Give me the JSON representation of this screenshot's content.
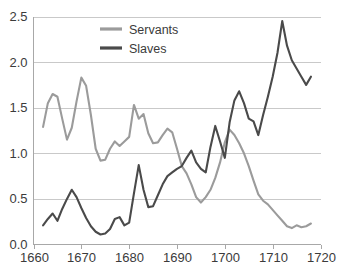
{
  "chart_data": {
    "type": "line",
    "title": "",
    "subtitle": "",
    "xlabel": "",
    "ylabel": "",
    "xlim": [
      1660,
      1720
    ],
    "ylim": [
      0.0,
      2.5
    ],
    "grid": true,
    "grid_axis": "y",
    "legend_position": "top-center",
    "x_ticks": [
      "1660",
      "1670",
      "1680",
      "1690",
      "1700",
      "1710",
      "1720"
    ],
    "x_tick_values": [
      1660,
      1670,
      1680,
      1690,
      1700,
      1710,
      1720
    ],
    "y_ticks": [
      "0.0",
      "0.5",
      "1.0",
      "1.5",
      "2.0",
      "2.5"
    ],
    "y_tick_values": [
      0.0,
      0.5,
      1.0,
      1.5,
      2.0,
      2.5
    ],
    "series": [
      {
        "name": "Servants",
        "color": "#9b9b9b",
        "x": [
          1662,
          1663,
          1664,
          1665,
          1666,
          1667,
          1668,
          1669,
          1670,
          1671,
          1672,
          1673,
          1674,
          1675,
          1676,
          1677,
          1678,
          1679,
          1680,
          1681,
          1682,
          1683,
          1684,
          1685,
          1686,
          1687,
          1688,
          1689,
          1690,
          1691,
          1692,
          1693,
          1694,
          1695,
          1696,
          1697,
          1698,
          1699,
          1700,
          1701,
          1702,
          1703,
          1704,
          1705,
          1706,
          1707,
          1708,
          1709,
          1710,
          1711,
          1712,
          1713,
          1714,
          1715,
          1716,
          1717,
          1718
        ],
        "values": [
          1.29,
          1.55,
          1.65,
          1.62,
          1.38,
          1.15,
          1.28,
          1.57,
          1.83,
          1.74,
          1.42,
          1.05,
          0.92,
          0.93,
          1.05,
          1.13,
          1.08,
          1.13,
          1.18,
          1.53,
          1.38,
          1.43,
          1.22,
          1.11,
          1.12,
          1.2,
          1.27,
          1.23,
          1.05,
          0.86,
          0.78,
          0.66,
          0.52,
          0.46,
          0.52,
          0.6,
          0.73,
          0.9,
          1.12,
          1.26,
          1.2,
          1.11,
          1.0,
          0.86,
          0.7,
          0.55,
          0.48,
          0.44,
          0.38,
          0.32,
          0.26,
          0.2,
          0.18,
          0.21,
          0.19,
          0.2,
          0.23
        ],
        "min": 0.18,
        "max": 1.83,
        "first": 1.29,
        "last": 0.23
      },
      {
        "name": "Slaves",
        "color": "#4a4a4a",
        "x": [
          1662,
          1663,
          1664,
          1665,
          1666,
          1667,
          1668,
          1669,
          1670,
          1671,
          1672,
          1673,
          1674,
          1675,
          1676,
          1677,
          1678,
          1679,
          1680,
          1681,
          1682,
          1683,
          1684,
          1685,
          1686,
          1687,
          1688,
          1689,
          1690,
          1691,
          1692,
          1693,
          1694,
          1695,
          1696,
          1697,
          1698,
          1699,
          1700,
          1701,
          1702,
          1703,
          1704,
          1705,
          1706,
          1707,
          1708,
          1709,
          1710,
          1711,
          1712,
          1713,
          1714,
          1715,
          1716,
          1717,
          1718
        ],
        "values": [
          0.21,
          0.28,
          0.34,
          0.26,
          0.39,
          0.5,
          0.6,
          0.52,
          0.4,
          0.29,
          0.2,
          0.14,
          0.11,
          0.12,
          0.17,
          0.28,
          0.3,
          0.21,
          0.24,
          0.56,
          0.87,
          0.6,
          0.41,
          0.42,
          0.54,
          0.66,
          0.75,
          0.79,
          0.83,
          0.86,
          0.95,
          1.03,
          0.9,
          0.83,
          0.79,
          1.07,
          1.3,
          1.13,
          0.95,
          1.34,
          1.58,
          1.68,
          1.55,
          1.38,
          1.35,
          1.2,
          1.42,
          1.62,
          1.84,
          2.1,
          2.45,
          2.18,
          2.02,
          1.93,
          1.84,
          1.75,
          1.84
        ],
        "min": 0.11,
        "max": 2.45,
        "first": 0.21,
        "last": 1.84
      }
    ],
    "legend": [
      {
        "label": "Servants",
        "color": "#9b9b9b"
      },
      {
        "label": "Slaves",
        "color": "#4a4a4a"
      }
    ]
  },
  "colors": {
    "servants": "#9b9b9b",
    "slaves": "#4a4a4a",
    "grid": "#c9c9c9",
    "axis": "#a8a8a8",
    "text": "#3b3b3b",
    "background": "#ffffff"
  }
}
